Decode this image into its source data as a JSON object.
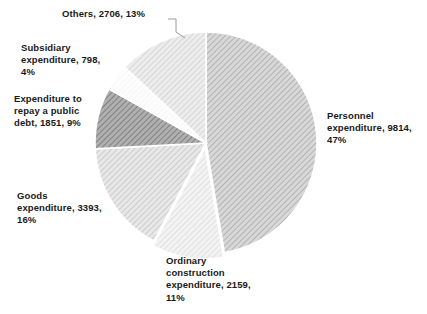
{
  "chart_data": {
    "type": "pie",
    "title": "",
    "subtitle": "",
    "xlabel": "",
    "ylabel": "",
    "legend_position": "none",
    "grid": false,
    "total": 20721,
    "units": "",
    "start_angle_deg": 0,
    "direction": "clockwise",
    "categories": [
      "Personnel expenditure",
      "Ordinary construction expenditure",
      "Goods expenditure",
      "Expenditure to repay a public debt",
      "Subsidiary expenditure",
      "Others"
    ],
    "values": [
      9814,
      2159,
      3393,
      1851,
      798,
      2706
    ],
    "percents": [
      47,
      11,
      16,
      9,
      4,
      13
    ],
    "slices": [
      {
        "name": "personnel",
        "category": "Personnel expenditure",
        "value": 9814,
        "percent": 47,
        "label": "Personnel\nexpenditure, 9814,\n47%",
        "fill": "#bdbdbd",
        "hatch": "diagonal",
        "exploded": false,
        "leader_line": false
      },
      {
        "name": "ordinary-construction",
        "category": "Ordinary construction expenditure",
        "value": 2159,
        "percent": 11,
        "label": "Ordinary\nconstruction\nexpenditure, 2159,\n11%",
        "fill": "#e6e6e6",
        "hatch": "diagonal",
        "exploded": true,
        "leader_line": false
      },
      {
        "name": "goods",
        "category": "Goods expenditure",
        "value": 3393,
        "percent": 16,
        "label": "Goods\nexpenditure, 3393,\n16%",
        "fill": "#d4d4d4",
        "hatch": "diagonal",
        "exploded": false,
        "leader_line": false
      },
      {
        "name": "public-debt",
        "category": "Expenditure to repay a public debt",
        "value": 1851,
        "percent": 9,
        "label": "Expenditure to\nrepay a public\ndebt, 1851, 9%",
        "fill": "#9a9a9a",
        "hatch": "diagonal",
        "exploded": false,
        "leader_line": false
      },
      {
        "name": "subsidiary",
        "category": "Subsidiary expenditure",
        "value": 798,
        "percent": 4,
        "label": "Subsidiary\nexpenditure, 798,\n4%",
        "fill": "#fbfbfb",
        "hatch": "none",
        "exploded": false,
        "leader_line": false
      },
      {
        "name": "others",
        "category": "Others",
        "value": 2706,
        "percent": 13,
        "label": "Others, 2706, 13%",
        "fill": "#dedede",
        "hatch": "diagonal",
        "exploded": false,
        "leader_line": true
      }
    ],
    "colors": {
      "background": "#ffffff",
      "text": "#1a1a1a",
      "slice_border": "#ffffff",
      "leader_line": "#9a9a9a"
    }
  }
}
